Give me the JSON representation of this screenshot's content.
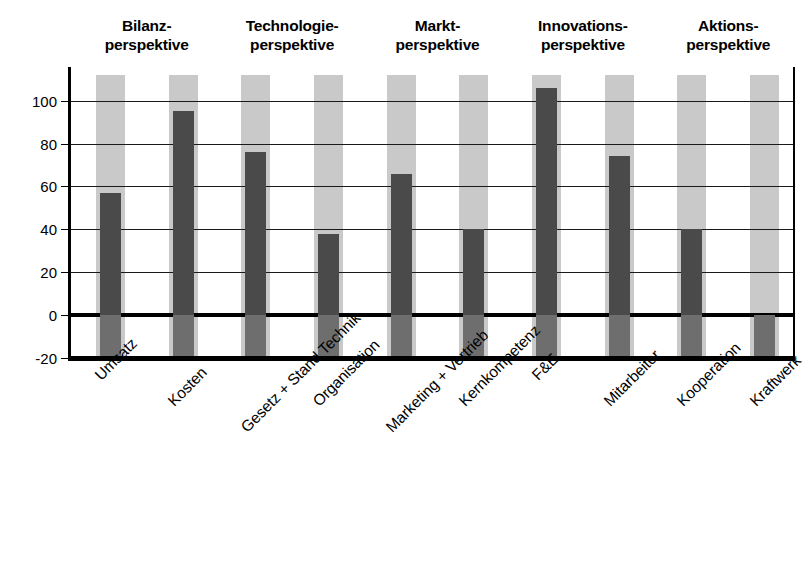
{
  "chart_data": {
    "type": "bar",
    "title": "",
    "xlabel": "",
    "ylabel": "",
    "ylim": [
      -20,
      112
    ],
    "yticks": [
      -20,
      0,
      20,
      40,
      60,
      80,
      100
    ],
    "ytick_labels": [
      "-20",
      "0",
      "20",
      "40",
      "60",
      "80",
      "100"
    ],
    "grid": true,
    "legend": false,
    "categories": [
      "Umsatz",
      "Kosten",
      "Gesetz + Stand Technik",
      "Organisation",
      "Marketing + Vertrieb",
      "Kernkompetenz",
      "F&E",
      "Mitarbeiter",
      "Kooperation",
      "Kraftwerk"
    ],
    "values": [
      57,
      95,
      76,
      38,
      66,
      40,
      106,
      74,
      40,
      0
    ],
    "baseline_value": -20,
    "colors": {
      "bar": "#4a4a4a",
      "band": "#c9c9c9",
      "axis": "#000000",
      "grid": "#1a1a1a",
      "background": "#ffffff"
    },
    "groups": [
      {
        "line1": "Bilanz-",
        "line2": "perspektive",
        "categories": [
          "Umsatz",
          "Kosten"
        ]
      },
      {
        "line1": "Technologie-",
        "line2": "perspektive",
        "categories": [
          "Gesetz + Stand Technik",
          "Organisation"
        ]
      },
      {
        "line1": "Markt-",
        "line2": "perspektive",
        "categories": [
          "Marketing + Vertrieb",
          "Kernkompetenz"
        ]
      },
      {
        "line1": "Innovations-",
        "line2": "perspektive",
        "categories": [
          "F&E",
          "Mitarbeiter"
        ]
      },
      {
        "line1": "Aktions-",
        "line2": "perspektive",
        "categories": [
          "Kooperation",
          "Kraftwerk"
        ]
      }
    ]
  },
  "caption": ""
}
